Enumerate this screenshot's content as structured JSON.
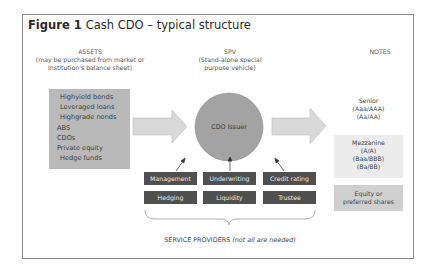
{
  "figure": {
    "label": "Figure 1",
    "title": "Cash CDO – typical structure"
  },
  "columns": {
    "assets": {
      "heading": "ASSETS",
      "sub1": "(may be purchased from market or",
      "sub2": "Institution's balance sheet)",
      "items": [
        "Highyield bonds",
        "Leveraged loans",
        "Highgrade nonds",
        "ABS",
        "CDOs",
        "Private equity",
        "Hedge funds"
      ],
      "box_color": "#b9b9b9"
    },
    "spv": {
      "heading": "SPV",
      "sub1": "(Stand-alone special",
      "sub2": "purpose vehicle)",
      "issuer_label": "CDO Issuer",
      "circle_color": "#a3a3a3"
    },
    "notes": {
      "heading": "NOTES",
      "tranches": [
        {
          "name": "Senior",
          "ratings": [
            "(Aaa/AAA)",
            "(Aa/AA)"
          ],
          "fill": "#ffffff"
        },
        {
          "name": "Mezzanine",
          "ratings": [
            "(A/A)",
            "(Baa/BBB)",
            "(Ba/BB)"
          ],
          "fill": "#ececec"
        },
        {
          "name": "Equity or",
          "ratings": [
            "preferred shares"
          ],
          "fill": "#cfcfcf"
        }
      ]
    }
  },
  "service_providers": {
    "items": [
      "Management",
      "Underwriting",
      "Credit rating",
      "Hedging",
      "Liquidity",
      "Trustee"
    ],
    "box_color": "#4f4f4f",
    "caption_main": "SERVICE PROVIDERS",
    "caption_note": "(not all are needed)"
  },
  "arrow_color": "#d9d9d9"
}
